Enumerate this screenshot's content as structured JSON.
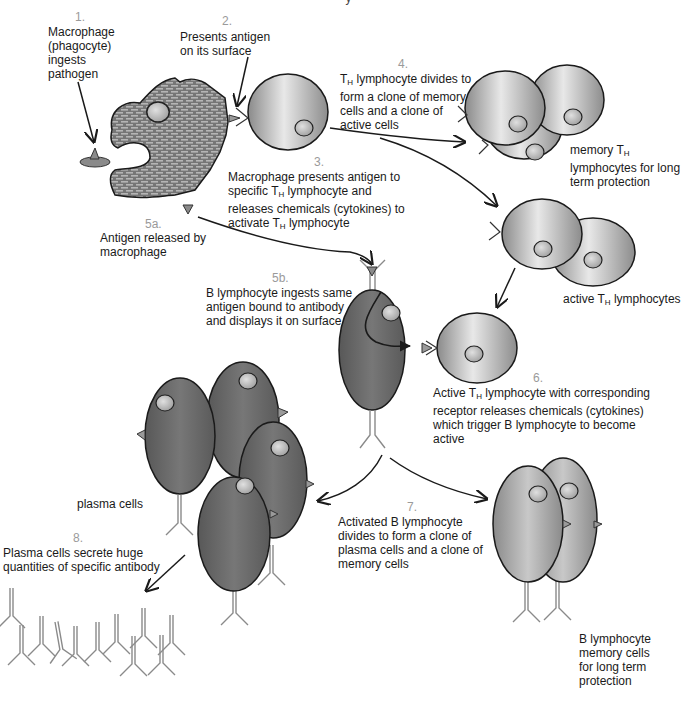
{
  "diagram": {
    "type": "biological-process",
    "topic": "Immune response: macrophage, helper T lymphocytes, B lymphocytes, plasma cells",
    "title_cut": "y",
    "colors": {
      "macrophage_fill": "#7a7a7a",
      "brick_pattern": "#b0b0b0",
      "th_cell_light": "#e6e6e6",
      "th_cell_dark": "#8c8c8c",
      "b_cell_fill": "#6b6b6b",
      "plasma_cell_fill": "#6a6a6a",
      "nucleus": "#bdbdbd",
      "antigen": "#8a8a8a",
      "antibody_stroke": "#8a8a8a",
      "arrow": "#1a1a1a",
      "step_number": "#9a9a9a",
      "text": "#1a1a1a"
    },
    "steps": [
      {
        "number": "1.",
        "text": "Macrophage\n(phagocyte)\ningests\npathogen"
      },
      {
        "number": "2.",
        "text": "Presents antigen\non its surface"
      },
      {
        "number": "3.",
        "text_lines": [
          "Macrophage presents antigen to",
          "specific T",
          "H",
          " lymphocyte and",
          "releases chemicals (cytokines) to",
          "activate T",
          "H",
          " lymphocyte"
        ]
      },
      {
        "number": "4.",
        "text_lines": [
          "T",
          "H",
          " lymphocyte divides to",
          "form a clone of memory",
          "cells and a clone of",
          "active cells"
        ]
      },
      {
        "number": "5a.",
        "text": "Antigen released by\nmacrophage"
      },
      {
        "number": "5b.",
        "text": "B lymphocyte ingests same\nantigen bound to antibody\nand displays it on surface"
      },
      {
        "number": "6.",
        "text_lines": [
          "Active T",
          "H",
          " lymphocyte with corresponding",
          "receptor releases chemicals (cytokines)",
          "which trigger B lymphocyte to become",
          "active"
        ]
      },
      {
        "number": "7.",
        "text": "Activated B lymphocyte\ndivides to form a clone of\nplasma cells and a clone of\nmemory cells"
      },
      {
        "number": "8.",
        "text": "Plasma cells secrete huge\nquantities of specific antibody"
      }
    ],
    "labels": {
      "memory_th": [
        "memory T",
        "H",
        "",
        "lymphocytes for long",
        "term protection"
      ],
      "active_th": [
        "active T",
        "H",
        " lymphocytes"
      ],
      "plasma_cells": "plasma cells",
      "b_memory": "B lymphocyte\nmemory cells\nfor long term\nprotection"
    },
    "nodes": [
      {
        "id": "macrophage",
        "label": "Macrophage"
      },
      {
        "id": "pathogen",
        "label": "Pathogen"
      },
      {
        "id": "th-lymphocyte",
        "label": "TH lymphocyte"
      },
      {
        "id": "memory-th-cells",
        "label": "memory TH lymphocytes",
        "count": 3
      },
      {
        "id": "active-th-cells",
        "label": "active TH lymphocytes",
        "count": 2
      },
      {
        "id": "free-antigen",
        "label": "Antigen"
      },
      {
        "id": "b-lymphocyte",
        "label": "B lymphocyte"
      },
      {
        "id": "active-th-cell-6",
        "label": "Active TH lymphocyte"
      },
      {
        "id": "plasma-cells",
        "label": "plasma cells",
        "count": 4
      },
      {
        "id": "b-memory-cells",
        "label": "B lymphocyte memory cells",
        "count": 2
      },
      {
        "id": "antibodies",
        "label": "specific antibody",
        "count": 13
      }
    ],
    "edges": [
      {
        "from": "pathogen",
        "to": "macrophage",
        "step": "1"
      },
      {
        "from": "macrophage",
        "to": "th-lymphocyte",
        "step": "2/3"
      },
      {
        "from": "th-lymphocyte",
        "to": "memory-th-cells",
        "step": "4"
      },
      {
        "from": "th-lymphocyte",
        "to": "active-th-cells",
        "step": "4"
      },
      {
        "from": "macrophage",
        "to": "b-lymphocyte",
        "step": "5a"
      },
      {
        "from": "active-th-cells",
        "to": "active-th-cell-6",
        "step": "6"
      },
      {
        "from": "b-lymphocyte",
        "to": "plasma-cells",
        "step": "7"
      },
      {
        "from": "b-lymphocyte",
        "to": "b-memory-cells",
        "step": "7"
      },
      {
        "from": "plasma-cells",
        "to": "antibodies",
        "step": "8"
      }
    ]
  }
}
